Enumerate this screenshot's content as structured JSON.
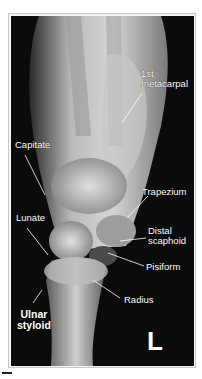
{
  "figure": {
    "type": "lateral wrist radiograph",
    "side_marker": "L",
    "colors": {
      "background": "#0b0b0b",
      "label": "#ffffff",
      "frame": "#c8c8c8"
    },
    "labels": [
      {
        "id": "first-metacarpal",
        "lines": [
          "1st",
          "metacarpal"
        ]
      },
      {
        "id": "capitate",
        "lines": [
          "Capitate"
        ]
      },
      {
        "id": "trapezium",
        "lines": [
          "Trapezium"
        ]
      },
      {
        "id": "lunate",
        "lines": [
          "Lunate"
        ]
      },
      {
        "id": "distal-scaphoid",
        "lines": [
          "Distal",
          "scaphoid"
        ]
      },
      {
        "id": "pisiform",
        "lines": [
          "Pisiform"
        ]
      },
      {
        "id": "radius",
        "lines": [
          "Radius"
        ]
      },
      {
        "id": "ulnar-styloid",
        "lines": [
          "Ulnar",
          "styloid"
        ]
      }
    ]
  }
}
